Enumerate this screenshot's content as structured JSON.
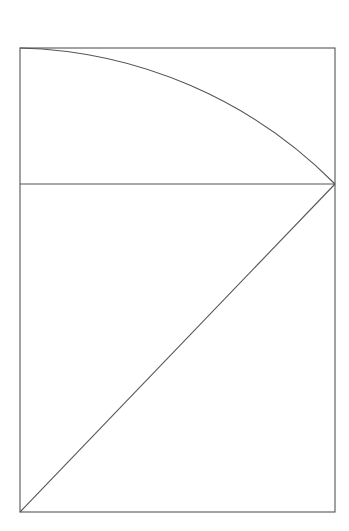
{
  "diagram": {
    "title": "",
    "canvas": {
      "width": 349,
      "height": 531,
      "background": "#ffffff"
    },
    "stroke_color": "#555555",
    "stroke_width": 1.1,
    "rectangle": {
      "x1": 20,
      "y1": 48,
      "x2": 335,
      "y2": 512
    },
    "horizontal_divider": {
      "x1": 20,
      "y1": 184,
      "x2": 335,
      "y2": 184
    },
    "diagonal": {
      "x1": 20,
      "y1": 512,
      "x2": 335,
      "y2": 184
    },
    "arc": {
      "start": [
        20,
        48
      ],
      "end": [
        335,
        184
      ],
      "center": [
        20,
        512
      ],
      "radius": 460
    },
    "labels": []
  }
}
